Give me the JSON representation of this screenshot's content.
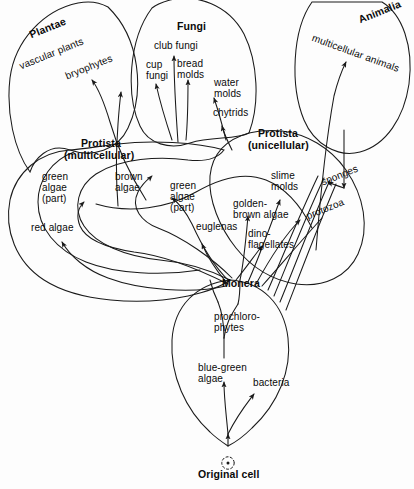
{
  "figure": {
    "type": "phylogenetic-tree-diagram",
    "title_label": "Original cell",
    "background_color": "#fdfdfd",
    "line_color": "#1a1a1a",
    "text_color": "#0a0a0a"
  },
  "kingdoms": [
    {
      "id": "plantae",
      "label": "Plantae",
      "x": 28,
      "y": 30,
      "rot": -22
    },
    {
      "id": "fungi",
      "label": "Fungi",
      "x": 177,
      "y": 21,
      "rot": 0
    },
    {
      "id": "animalia",
      "label": "Animalia",
      "x": 357,
      "y": 15,
      "rot": -22
    },
    {
      "id": "monera",
      "label": "Monera",
      "x": 222,
      "y": 278,
      "rot": 0
    }
  ],
  "groups": [
    {
      "id": "protista-multicellular",
      "line1": "Protista",
      "line2": "(multicellular)",
      "x": 77,
      "y": 138
    },
    {
      "id": "protista-unicellular",
      "line1": "Protista",
      "line2": "(unicellular)",
      "x": 253,
      "y": 128
    }
  ],
  "taxa": [
    {
      "id": "vascular-plants",
      "text": "vascular plants",
      "x": 18,
      "y": 62,
      "rot": -22
    },
    {
      "id": "bryophytes",
      "text": "bryophytes",
      "x": 64,
      "y": 72,
      "rot": -22
    },
    {
      "id": "club-fungi",
      "text": "club fungi",
      "x": 154,
      "y": 41,
      "rot": 0
    },
    {
      "id": "cup-fungi",
      "text": "cup\nfungi",
      "x": 146,
      "y": 60,
      "rot": 0
    },
    {
      "id": "bread-molds",
      "text": "bread\nmolds",
      "x": 177,
      "y": 59,
      "rot": 0
    },
    {
      "id": "water-molds",
      "text": "water\nmolds",
      "x": 214,
      "y": 78,
      "rot": 0
    },
    {
      "id": "chytrids",
      "text": "chytrids",
      "x": 213,
      "y": 108,
      "rot": 0
    },
    {
      "id": "multicellular-animals",
      "text": "multicellular animals",
      "x": 314,
      "y": 33,
      "rot": 20
    },
    {
      "id": "green-algae-part-1",
      "text": "green\nalgae\n(part)",
      "x": 42,
      "y": 172,
      "rot": 0
    },
    {
      "id": "brown-algae",
      "text": "brown\nalgae",
      "x": 115,
      "y": 172,
      "rot": 0
    },
    {
      "id": "green-algae-part-2",
      "text": "green\nalgae\n(part)",
      "x": 170,
      "y": 181,
      "rot": 0
    },
    {
      "id": "red-algae",
      "text": "red algae",
      "x": 31,
      "y": 223,
      "rot": 0
    },
    {
      "id": "euglenas",
      "text": "euglenas",
      "x": 196,
      "y": 222,
      "rot": 0
    },
    {
      "id": "golden-brown-algae",
      "text": "golden-\nbrown algae",
      "x": 233,
      "y": 199,
      "rot": 0
    },
    {
      "id": "dinoflagellates",
      "text": "dino-\nflagellates",
      "x": 248,
      "y": 229,
      "rot": 0
    },
    {
      "id": "slime-molds",
      "text": "slime\nmolds",
      "x": 271,
      "y": 171,
      "rot": 0
    },
    {
      "id": "sponges",
      "text": "sponges",
      "x": 320,
      "y": 178,
      "rot": -22
    },
    {
      "id": "protozoa",
      "text": "protozoa",
      "x": 305,
      "y": 212,
      "rot": -22
    },
    {
      "id": "prochlorophytes",
      "text": "prochloro-\nphytes",
      "x": 214,
      "y": 312,
      "rot": 0
    },
    {
      "id": "blue-green-algae",
      "text": "blue-green\nalgae",
      "x": 198,
      "y": 363,
      "rot": 0
    },
    {
      "id": "bacteria",
      "text": "bacteria",
      "x": 253,
      "y": 378,
      "rot": 0
    }
  ],
  "origin": {
    "id": "original-cell",
    "label": "Original cell",
    "x": 198,
    "y": 469
  }
}
